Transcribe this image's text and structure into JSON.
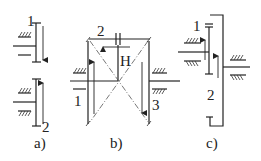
{
  "figure": {
    "panels": [
      {
        "id": "a",
        "caption": "a)",
        "labels": {
          "top": "1",
          "bottom": "2"
        },
        "description": "Two external gears: gear 1 moving down, gear 2 moving up"
      },
      {
        "id": "b",
        "caption": "b)",
        "labels": {
          "left": "1",
          "top": "2",
          "carrier": "H",
          "right": "3"
        },
        "description": "Planetary bevel arrangement with carrier H; gear 1 arrow up, gear 2 arrow left, gear 3 arrow down"
      },
      {
        "id": "c",
        "caption": "c)",
        "labels": {
          "top": "1",
          "middle": "2"
        },
        "description": "Internal gear pair: gear 1 and internal gear 2, both arrows up"
      }
    ],
    "colors": {
      "line": "#222222",
      "background": "#ffffff"
    }
  }
}
